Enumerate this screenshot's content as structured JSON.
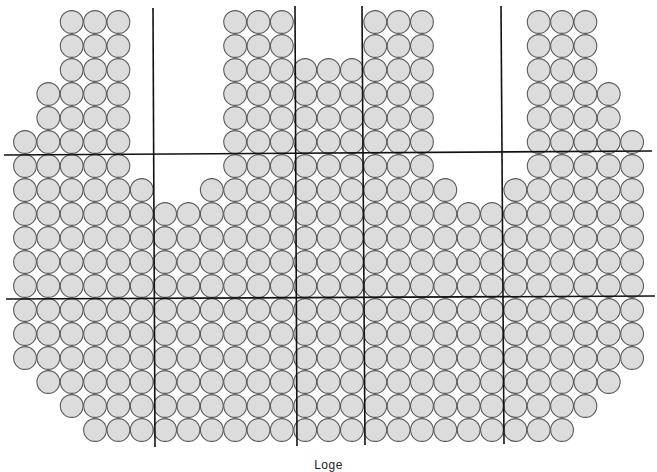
{
  "seatmap": {
    "label": "Loge",
    "colors": {
      "seat_fill": "#dcdcdc",
      "seat_stroke": "#5a5a5a",
      "divider": "#111111",
      "background": "#ffffff"
    },
    "grid": {
      "col_x0": 25,
      "col_pitch": 23.35,
      "row_y0": 22,
      "row_pitch": 24,
      "seat_radius": 11.4,
      "columns": 27,
      "rows": 18
    },
    "rows": [
      {
        "row": 0,
        "ranges": [
          [
            2,
            4
          ],
          [
            9,
            11
          ],
          [
            15,
            17
          ],
          [
            22,
            24
          ]
        ]
      },
      {
        "row": 1,
        "ranges": [
          [
            2,
            4
          ],
          [
            9,
            11
          ],
          [
            15,
            17
          ],
          [
            22,
            24
          ]
        ]
      },
      {
        "row": 2,
        "ranges": [
          [
            2,
            4
          ],
          [
            9,
            17
          ],
          [
            22,
            24
          ]
        ]
      },
      {
        "row": 3,
        "ranges": [
          [
            1,
            4
          ],
          [
            9,
            17
          ],
          [
            22,
            25
          ]
        ]
      },
      {
        "row": 4,
        "ranges": [
          [
            1,
            4
          ],
          [
            9,
            17
          ],
          [
            22,
            25
          ]
        ]
      },
      {
        "row": 5,
        "ranges": [
          [
            0,
            4
          ],
          [
            9,
            17
          ],
          [
            22,
            26
          ]
        ]
      },
      {
        "row": 6,
        "ranges": [
          [
            0,
            4
          ],
          [
            9,
            17
          ],
          [
            22,
            26
          ]
        ]
      },
      {
        "row": 7,
        "ranges": [
          [
            0,
            5
          ],
          [
            8,
            18
          ],
          [
            21,
            26
          ]
        ]
      },
      {
        "row": 8,
        "ranges": [
          [
            0,
            26
          ]
        ]
      },
      {
        "row": 9,
        "ranges": [
          [
            0,
            26
          ]
        ]
      },
      {
        "row": 10,
        "ranges": [
          [
            0,
            26
          ]
        ]
      },
      {
        "row": 11,
        "ranges": [
          [
            0,
            26
          ]
        ]
      },
      {
        "row": 12,
        "ranges": [
          [
            0,
            26
          ]
        ]
      },
      {
        "row": 13,
        "ranges": [
          [
            0,
            26
          ]
        ]
      },
      {
        "row": 14,
        "ranges": [
          [
            0,
            26
          ]
        ]
      },
      {
        "row": 15,
        "ranges": [
          [
            1,
            25
          ]
        ]
      },
      {
        "row": 16,
        "ranges": [
          [
            2,
            24
          ]
        ]
      },
      {
        "row": 17,
        "ranges": [
          [
            3,
            23
          ]
        ]
      }
    ],
    "dividers": {
      "horizontal": [
        {
          "x1": 4,
          "y1": 155,
          "x2": 652,
          "y2": 151
        },
        {
          "x1": 6,
          "y1": 299,
          "x2": 655,
          "y2": 296
        }
      ],
      "vertical": [
        {
          "x1": 153,
          "y1": 8,
          "x2": 155,
          "y2": 447
        },
        {
          "x1": 295,
          "y1": 6,
          "x2": 297,
          "y2": 446
        },
        {
          "x1": 362,
          "y1": 6,
          "x2": 365,
          "y2": 445
        },
        {
          "x1": 501,
          "y1": 6,
          "x2": 504,
          "y2": 444
        }
      ]
    }
  }
}
